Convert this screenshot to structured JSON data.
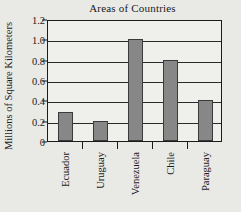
{
  "chart_data": {
    "type": "bar",
    "title": "Areas of Countries",
    "xlabel": "",
    "ylabel": "Millions of Square Kilometers",
    "categories": [
      "Ecuador",
      "Uruguay",
      "Venezuela",
      "Chile",
      "Paraguay"
    ],
    "values": [
      0.29,
      0.2,
      1.0,
      0.8,
      0.4
    ],
    "ylim": [
      0,
      1.2
    ],
    "yticks": [
      "0",
      "0.2",
      "0.4",
      "0.6",
      "0.8",
      "1.0",
      "1.2"
    ],
    "ytick_values": [
      0,
      0.2,
      0.4,
      0.6,
      0.8,
      1.0,
      1.2
    ],
    "grid": true,
    "legend": false,
    "bar_color": "#878787",
    "bar_edge_color": "#3a3a3a",
    "axis_color": "#1b1b1b",
    "background_color": "#e9e9e6",
    "plot_background_color": "#efefec"
  }
}
